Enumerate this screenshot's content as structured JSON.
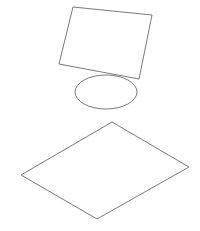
{
  "canvas": {
    "width": 200,
    "height": 231,
    "background": "#ffffff"
  },
  "stroke": {
    "color": "#7a7a7a",
    "width": 1
  },
  "shapes": [
    {
      "type": "quadrilateral",
      "name": "parallelogram",
      "points": "73,7 152,15 139,79 59,64"
    },
    {
      "type": "ellipse",
      "name": "ellipse",
      "cx": 106,
      "cy": 92,
      "rx": 31,
      "ry": 17
    },
    {
      "type": "rhombus",
      "name": "diamond",
      "points": "112,122 189,167 97,219 21,175"
    }
  ]
}
